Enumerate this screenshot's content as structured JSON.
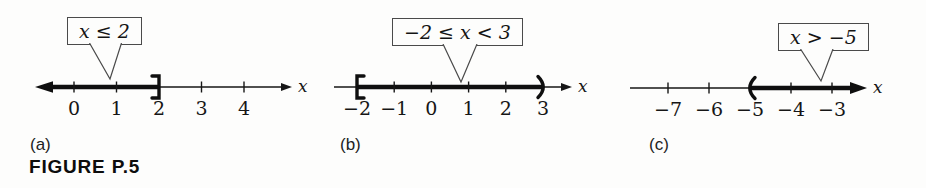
{
  "figure": {
    "caption": "FIGURE P.5"
  },
  "colors": {
    "ink": "#161616",
    "thick_ink": "#0f0f0f",
    "callout_border": "#4a4a4a",
    "background": "#fdfdfc"
  },
  "panels": [
    {
      "id": "a",
      "panel_label": "(a)",
      "callout_text": "x ≤ 2",
      "axis_label": "x",
      "tick_labels": [
        "0",
        "1",
        "2",
        "3",
        "4"
      ],
      "interval": {
        "description": "x ≤ 2",
        "left_symbol": "arrow",
        "from_label": null,
        "right_symbol": "]",
        "to_label": "2"
      }
    },
    {
      "id": "b",
      "panel_label": "(b)",
      "callout_text": "−2 ≤ x < 3",
      "axis_label": "x",
      "tick_labels": [
        "−2",
        "−1",
        "0",
        "1",
        "2",
        "3"
      ],
      "interval": {
        "description": "−2 ≤ x < 3",
        "left_symbol": "[",
        "from_label": "−2",
        "right_symbol": ")",
        "to_label": "3"
      }
    },
    {
      "id": "c",
      "panel_label": "(c)",
      "callout_text": "x > −5",
      "axis_label": "x",
      "tick_labels": [
        "−7",
        "−6",
        "−5",
        "−4",
        "−3"
      ],
      "interval": {
        "description": "x > −5",
        "left_symbol": "(",
        "from_label": "−5",
        "right_symbol": "arrow",
        "to_label": null
      }
    }
  ]
}
